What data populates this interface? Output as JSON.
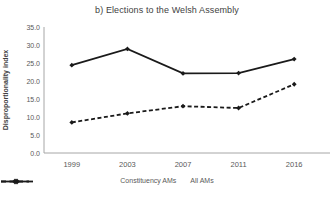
{
  "title": "b) Elections to the Welsh Assembly",
  "chart_data": {
    "type": "line",
    "title": "b) Elections to the Welsh Assembly",
    "xlabel": "",
    "ylabel": "Disproportionality index",
    "categories": [
      "1999",
      "2003",
      "2007",
      "2011",
      "2016"
    ],
    "series": [
      {
        "name": "Constituency AMs",
        "style": "solid",
        "values": [
          24.4,
          28.9,
          22.1,
          22.2,
          26.1
        ]
      },
      {
        "name": "All AMs",
        "style": "dashed",
        "values": [
          8.5,
          11.0,
          13.0,
          12.5,
          19.1
        ]
      }
    ],
    "ylim": [
      0,
      35
    ],
    "ytick_step": 5,
    "ytick_labels": [
      "0.0",
      "5.0",
      "10.0",
      "15.0",
      "20.0",
      "25.0",
      "30.0",
      "35.0"
    ],
    "grid": false,
    "legend_position": "bottom",
    "line_color": "#1a1a1a",
    "axis_color": "#a6a6a6",
    "tick_label_color": "#595959",
    "marker": "diamond"
  }
}
